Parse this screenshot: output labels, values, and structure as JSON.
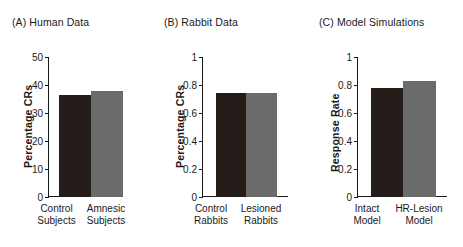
{
  "figure": {
    "panels": [
      {
        "id": "a",
        "title": "(A) Human Data",
        "ylabel": "Percentage CRs",
        "yticks": [
          "0",
          "10",
          "20",
          "30",
          "40",
          "50"
        ],
        "categories": [
          {
            "line1": "Control",
            "line2": "Subjects"
          },
          {
            "line1": "Amnesic",
            "line2": "Subjects"
          }
        ]
      },
      {
        "id": "b",
        "title": "(B) Rabbit Data",
        "ylabel": "Percentage CRs",
        "yticks": [
          "0",
          "0.2",
          "0.4",
          "0.6",
          "0.8",
          "1"
        ],
        "categories": [
          {
            "line1": "Control",
            "line2": "Rabbits"
          },
          {
            "line1": "Lesioned",
            "line2": "Rabbits"
          }
        ]
      },
      {
        "id": "c",
        "title": "(C) Model Simulations",
        "ylabel": "Response Rate",
        "yticks": [
          "0",
          "0.2",
          "0.4",
          "0.6",
          "0.8",
          "1"
        ],
        "categories": [
          {
            "line1": "Intact",
            "line2": "Model"
          },
          {
            "line1": "HR-Lesion",
            "line2": "Model"
          }
        ]
      }
    ],
    "colors": {
      "bar_dark": "#231c19",
      "bar_light": "#6b6b6b",
      "axis": "#1a1a1a",
      "background": "#ffffff"
    }
  },
  "chart_data": [
    {
      "type": "bar",
      "title": "(A) Human Data",
      "categories": [
        "Control Subjects",
        "Amnesic Subjects"
      ],
      "values": [
        36.5,
        37.8
      ],
      "xlabel": "",
      "ylabel": "Percentage CRs",
      "ylim": [
        0,
        50
      ],
      "yticks": [
        0,
        10,
        20,
        30,
        40,
        50
      ],
      "grid": false,
      "legend": "none",
      "bar_colors": [
        "#231c19",
        "#6b6b6b"
      ]
    },
    {
      "type": "bar",
      "title": "(B) Rabbit Data",
      "categories": [
        "Control Rabbits",
        "Lesioned Rabbits"
      ],
      "values": [
        0.745,
        0.74
      ],
      "xlabel": "",
      "ylabel": "Percentage CRs",
      "ylim": [
        0,
        1
      ],
      "yticks": [
        0,
        0.2,
        0.4,
        0.6,
        0.8,
        1
      ],
      "grid": false,
      "legend": "none",
      "bar_colors": [
        "#231c19",
        "#6b6b6b"
      ]
    },
    {
      "type": "bar",
      "title": "(C) Model Simulations",
      "categories": [
        "Intact Model",
        "HR-Lesion Model"
      ],
      "values": [
        0.78,
        0.83
      ],
      "xlabel": "",
      "ylabel": "Response Rate",
      "ylim": [
        0,
        1
      ],
      "yticks": [
        0,
        0.2,
        0.4,
        0.6,
        0.8,
        1
      ],
      "grid": false,
      "legend": "none",
      "bar_colors": [
        "#231c19",
        "#6b6b6b"
      ]
    }
  ]
}
